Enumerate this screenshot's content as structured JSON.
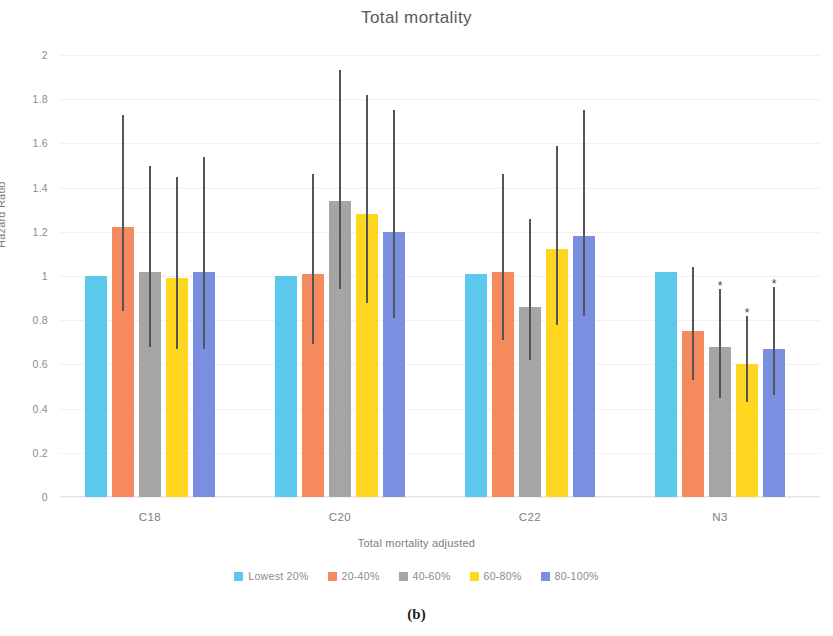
{
  "figure": {
    "caption": "(b)"
  },
  "chart_data": {
    "type": "bar",
    "title": "Total mortality",
    "xlabel": "Total mortality adjusted",
    "ylabel": "Hazard Ratio",
    "categories": [
      "C18",
      "C20",
      "C22",
      "N3"
    ],
    "ylim": [
      0,
      2
    ],
    "yticks": [
      0,
      0.2,
      0.4,
      0.6,
      0.8,
      1,
      1.2,
      1.4,
      1.6,
      1.8,
      2
    ],
    "ytick_labels": [
      "0",
      "0.2",
      "0.4",
      "0.6",
      "0.8",
      "1",
      "1.2",
      "1.4",
      "1.6",
      "1.8",
      "2"
    ],
    "grid": true,
    "legend_position": "bottom",
    "series": [
      {
        "name": "Lowest 20%",
        "color": "#5BC8EC",
        "values": [
          1.0,
          1.0,
          1.01,
          1.02
        ],
        "ci_low": [
          null,
          null,
          null,
          null
        ],
        "ci_high": [
          null,
          null,
          null,
          null
        ],
        "significant": [
          false,
          false,
          false,
          false
        ]
      },
      {
        "name": "20-40%",
        "color": "#F58A5E",
        "values": [
          1.22,
          1.01,
          1.02,
          0.75
        ],
        "ci_low": [
          0.84,
          0.69,
          0.71,
          0.53
        ],
        "ci_high": [
          1.73,
          1.46,
          1.46,
          1.04
        ],
        "significant": [
          false,
          false,
          false,
          false
        ]
      },
      {
        "name": "40-60%",
        "color": "#A5A5A5",
        "values": [
          1.02,
          1.34,
          0.86,
          0.68
        ],
        "ci_low": [
          0.68,
          0.94,
          0.62,
          0.45
        ],
        "ci_high": [
          1.5,
          1.93,
          1.26,
          0.94
        ],
        "significant": [
          false,
          false,
          false,
          true
        ]
      },
      {
        "name": "60-80%",
        "color": "#FFD720",
        "values": [
          0.99,
          1.28,
          1.12,
          0.6
        ],
        "ci_low": [
          0.67,
          0.88,
          0.78,
          0.43
        ],
        "ci_high": [
          1.45,
          1.82,
          1.59,
          0.82
        ],
        "significant": [
          false,
          false,
          false,
          true
        ]
      },
      {
        "name": "80-100%",
        "color": "#7B8FE0",
        "values": [
          1.02,
          1.2,
          1.18,
          0.67
        ],
        "ci_low": [
          0.67,
          0.81,
          0.82,
          0.46
        ],
        "ci_high": [
          1.54,
          1.75,
          1.75,
          0.95
        ],
        "significant": [
          false,
          false,
          false,
          true
        ]
      }
    ],
    "significance_marker": "*"
  }
}
